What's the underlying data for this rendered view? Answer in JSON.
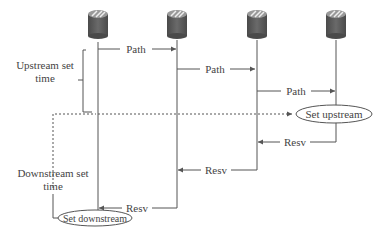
{
  "diagram": {
    "type": "RSVP signaling sequence",
    "routers": [
      {
        "id": "router-1",
        "x": 98
      },
      {
        "id": "router-2",
        "x": 177
      },
      {
        "id": "router-3",
        "x": 257
      },
      {
        "id": "router-4",
        "x": 336
      }
    ],
    "messages": {
      "path1": "Path",
      "path2": "Path",
      "path3": "Path",
      "resv1": "Resv",
      "resv2": "Resv",
      "resv3": "Resv"
    },
    "labels": {
      "upstream_line1": "Upstream set",
      "upstream_line2": "time",
      "downstream_line1": "Downstream set",
      "downstream_line2": "time"
    },
    "events": {
      "set_upstream": "Set upstream",
      "set_downstream": "Set downstream"
    },
    "colors": {
      "line": "#555555",
      "text": "#444444",
      "router_body": "#555555",
      "router_top": "#8a8a8a"
    }
  }
}
